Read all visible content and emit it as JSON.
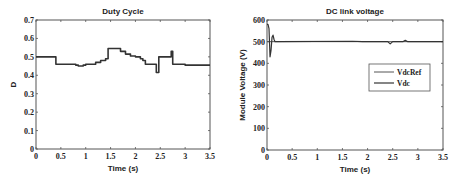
{
  "chart_data": [
    {
      "type": "line",
      "title": "Duty Cycle",
      "xlabel": "Time (s)",
      "ylabel": "D",
      "xlim": [
        0,
        3.5
      ],
      "ylim": [
        0,
        0.7
      ],
      "xticks": [
        "0",
        "0.5",
        "1",
        "1.5",
        "2",
        "2.5",
        "3",
        "3.5"
      ],
      "yticks": [
        "0",
        "0.1",
        "0.2",
        "0.3",
        "0.4",
        "0.5",
        "0.6",
        "0.7"
      ],
      "grid": false,
      "series": [
        {
          "name": "D",
          "x": [
            0,
            0.38,
            0.4,
            0.8,
            0.85,
            0.95,
            1.0,
            1.2,
            1.3,
            1.4,
            1.45,
            1.6,
            1.7,
            1.8,
            1.9,
            2.0,
            2.1,
            2.15,
            2.2,
            2.35,
            2.42,
            2.47,
            2.6,
            2.7,
            2.72,
            2.75,
            3.0,
            3.5
          ],
          "y": [
            0.5,
            0.5,
            0.46,
            0.455,
            0.45,
            0.455,
            0.46,
            0.47,
            0.48,
            0.49,
            0.545,
            0.545,
            0.53,
            0.515,
            0.505,
            0.5,
            0.49,
            0.48,
            0.46,
            0.46,
            0.415,
            0.5,
            0.5,
            0.5,
            0.53,
            0.46,
            0.455,
            0.455
          ]
        }
      ]
    },
    {
      "type": "line",
      "title": "DC link voltage",
      "xlabel": "Time (s)",
      "ylabel": "Module Voltage (V)",
      "xlim": [
        0,
        3.5
      ],
      "ylim": [
        0,
        600
      ],
      "xticks": [
        "0",
        "0.5",
        "1",
        "1.5",
        "2",
        "2.5",
        "3",
        "3.5"
      ],
      "yticks": [
        "0",
        "100",
        "200",
        "300",
        "400",
        "500",
        "600"
      ],
      "grid": false,
      "legend": {
        "position": "center-right",
        "entries": [
          "VdcRef",
          "Vdc"
        ]
      },
      "series": [
        {
          "name": "VdcRef",
          "x": [
            0,
            3.5
          ],
          "y": [
            500,
            500
          ]
        },
        {
          "name": "Vdc",
          "x": [
            0,
            0.02,
            0.04,
            0.06,
            0.08,
            0.1,
            0.12,
            0.14,
            0.16,
            0.2,
            1.7,
            1.9,
            2.4,
            2.45,
            2.5,
            2.7,
            2.75,
            2.8,
            3.5
          ],
          "y": [
            580,
            580,
            560,
            430,
            460,
            520,
            530,
            510,
            500,
            500,
            502,
            500,
            500,
            490,
            500,
            500,
            506,
            500,
            500
          ]
        }
      ]
    }
  ]
}
